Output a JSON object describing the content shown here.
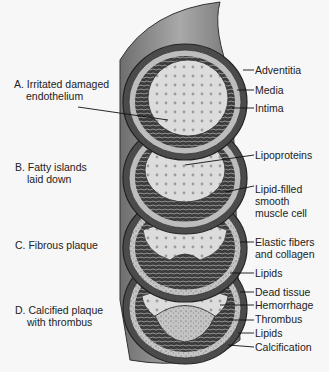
{
  "diagram": {
    "stages": [
      {
        "id": "A",
        "label": "A. Irritated damaged\nendothelium",
        "line1": "A. Irritated damaged",
        "line2": "endothelium"
      },
      {
        "id": "B",
        "label": "B. Fatty islands laid down",
        "line1": "B. Fatty islands",
        "line2": "laid down"
      },
      {
        "id": "C",
        "label": "C. Fibrous plaque",
        "line1": "C. Fibrous plaque"
      },
      {
        "id": "D",
        "label": "D. Calcified plaque with thrombus",
        "line1": "D. Calcified plaque",
        "line2": "with thrombus"
      }
    ],
    "right_labels": {
      "adventitia": "Adventitia",
      "media": "Media",
      "intima": "Intima",
      "lipoproteins": "Lipoproteins",
      "lipid_filled_1": "Lipid-filled",
      "lipid_filled_2": "smooth",
      "lipid_filled_3": "muscle cell",
      "elastic_1": "Elastic fibers",
      "elastic_2": "and collagen",
      "lipids_c": "Lipids",
      "dead_tissue": "Dead tissue",
      "hemorrhage": "Hemorrhage",
      "thrombus": "Thrombus",
      "lipids_d": "Lipids",
      "calcification": "Calcification"
    },
    "colors": {
      "vessel_outer": "#8a8a8a",
      "vessel_wall": "#5a5a5a",
      "lumen": "#d9d9d9",
      "dots": "#a0a0a0",
      "line": "#111111"
    }
  }
}
